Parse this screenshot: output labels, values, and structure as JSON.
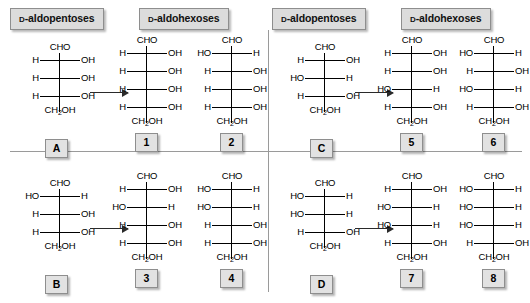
{
  "diagram": {
    "title_visible": false,
    "headers": [
      {
        "id": "hdr-pentose-left",
        "prefix": "D",
        "text": "-aldopentoses"
      },
      {
        "id": "hdr-hexose-left",
        "prefix": "D",
        "text": "-aldohexoses"
      },
      {
        "id": "hdr-pentose-right",
        "prefix": "D",
        "text": "-aldopentoses"
      },
      {
        "id": "hdr-hexose-right",
        "prefix": "D",
        "text": "-aldohexoses"
      }
    ],
    "top_group": "CHO",
    "bottom_group": "CH2OH",
    "bottom_group_prefix": "CH",
    "bottom_group_sub": "2",
    "bottom_group_suffix": "OH",
    "structures": [
      {
        "label": "A",
        "kind": "aldopentose",
        "quadrant": "top-left",
        "top": "CHO",
        "bottom": "CH2OH",
        "rungs": [
          {
            "left": "H",
            "right": "OH"
          },
          {
            "left": "H",
            "right": "OH"
          },
          {
            "left": "H",
            "right": "OH"
          }
        ]
      },
      {
        "label": "1",
        "kind": "aldohexose",
        "quadrant": "top-left",
        "top": "CHO",
        "bottom": "CH2OH",
        "rungs": [
          {
            "left": "H",
            "right": "OH"
          },
          {
            "left": "H",
            "right": "OH"
          },
          {
            "left": "H",
            "right": "OH"
          },
          {
            "left": "H",
            "right": "OH"
          }
        ]
      },
      {
        "label": "2",
        "kind": "aldohexose",
        "quadrant": "top-left",
        "top": "CHO",
        "bottom": "CH2OH",
        "rungs": [
          {
            "left": "HO",
            "right": "H"
          },
          {
            "left": "H",
            "right": "OH"
          },
          {
            "left": "H",
            "right": "OH"
          },
          {
            "left": "H",
            "right": "OH"
          }
        ]
      },
      {
        "label": "B",
        "kind": "aldopentose",
        "quadrant": "bottom-left",
        "top": "CHO",
        "bottom": "CH2OH",
        "rungs": [
          {
            "left": "HO",
            "right": "H"
          },
          {
            "left": "H",
            "right": "OH"
          },
          {
            "left": "H",
            "right": "OH"
          }
        ]
      },
      {
        "label": "3",
        "kind": "aldohexose",
        "quadrant": "bottom-left",
        "top": "CHO",
        "bottom": "CH2OH",
        "rungs": [
          {
            "left": "H",
            "right": "OH"
          },
          {
            "left": "HO",
            "right": "H"
          },
          {
            "left": "H",
            "right": "OH"
          },
          {
            "left": "H",
            "right": "OH"
          }
        ]
      },
      {
        "label": "4",
        "kind": "aldohexose",
        "quadrant": "bottom-left",
        "top": "CHO",
        "bottom": "CH2OH",
        "rungs": [
          {
            "left": "HO",
            "right": "H"
          },
          {
            "left": "HO",
            "right": "H"
          },
          {
            "left": "H",
            "right": "OH"
          },
          {
            "left": "H",
            "right": "OH"
          }
        ]
      },
      {
        "label": "C",
        "kind": "aldopentose",
        "quadrant": "top-right",
        "top": "CHO",
        "bottom": "CH2OH",
        "rungs": [
          {
            "left": "H",
            "right": "OH"
          },
          {
            "left": "HO",
            "right": "H"
          },
          {
            "left": "H",
            "right": "OH"
          }
        ]
      },
      {
        "label": "5",
        "kind": "aldohexose",
        "quadrant": "top-right",
        "top": "CHO",
        "bottom": "CH2OH",
        "rungs": [
          {
            "left": "H",
            "right": "OH"
          },
          {
            "left": "H",
            "right": "OH"
          },
          {
            "left": "HO",
            "right": "H"
          },
          {
            "left": "H",
            "right": "OH"
          }
        ]
      },
      {
        "label": "6",
        "kind": "aldohexose",
        "quadrant": "top-right",
        "top": "CHO",
        "bottom": "CH2OH",
        "rungs": [
          {
            "left": "HO",
            "right": "H"
          },
          {
            "left": "H",
            "right": "OH"
          },
          {
            "left": "HO",
            "right": "H"
          },
          {
            "left": "H",
            "right": "OH"
          }
        ]
      },
      {
        "label": "D",
        "kind": "aldopentose",
        "quadrant": "bottom-right",
        "top": "CHO",
        "bottom": "CH2OH",
        "rungs": [
          {
            "left": "HO",
            "right": "H"
          },
          {
            "left": "HO",
            "right": "H"
          },
          {
            "left": "H",
            "right": "OH"
          }
        ]
      },
      {
        "label": "7",
        "kind": "aldohexose",
        "quadrant": "bottom-right",
        "top": "CHO",
        "bottom": "CH2OH",
        "rungs": [
          {
            "left": "H",
            "right": "OH"
          },
          {
            "left": "HO",
            "right": "H"
          },
          {
            "left": "HO",
            "right": "H"
          },
          {
            "left": "H",
            "right": "OH"
          }
        ]
      },
      {
        "label": "8",
        "kind": "aldohexose",
        "quadrant": "bottom-right",
        "top": "CHO",
        "bottom": "CH2OH",
        "rungs": [
          {
            "left": "HO",
            "right": "H"
          },
          {
            "left": "HO",
            "right": "H"
          },
          {
            "left": "HO",
            "right": "H"
          },
          {
            "left": "H",
            "right": "OH"
          }
        ]
      }
    ],
    "arrows": [
      {
        "id": "arrow-a",
        "from": "A",
        "to": "1"
      },
      {
        "id": "arrow-b",
        "from": "B",
        "to": "3"
      },
      {
        "id": "arrow-c",
        "from": "C",
        "to": "5"
      },
      {
        "id": "arrow-d",
        "from": "D",
        "to": "7"
      }
    ],
    "colors": {
      "background": "#ffffff",
      "ink": "#000000",
      "chip_fill": "#dcdcdc",
      "chip_border": "#8e8e8e",
      "label_fill": "#e2e2e2",
      "divider": "#9a9a9a",
      "arrow": "#2a2a2a"
    }
  }
}
